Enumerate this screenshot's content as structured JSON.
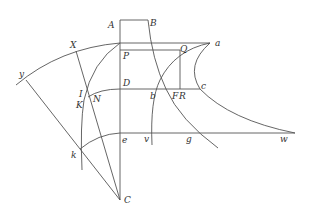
{
  "diagram": {
    "type": "geometric-construction",
    "labels": {
      "A": "A",
      "B": "B",
      "P": "P",
      "Q": "Q",
      "a": "a",
      "X": "X",
      "y": "y",
      "D": "D",
      "I": "I",
      "K": "K",
      "N": "N",
      "b": "b",
      "F": "F",
      "R": "R",
      "c": "c",
      "e": "e",
      "v": "v",
      "g": "g",
      "w": "w",
      "k": "k",
      "C": "C"
    }
  }
}
